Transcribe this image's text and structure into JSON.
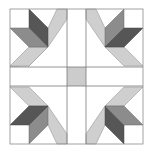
{
  "figure": {
    "type": "quilt-block",
    "colors": {
      "background": "#ffffff",
      "outline": "#8a8a8a",
      "dark": "#565656",
      "medium": "#8c8c8c",
      "light": "#cfcfcf",
      "center": "#cccccc"
    },
    "bounds": {
      "x": 10,
      "y": 8,
      "width": 133,
      "height": 137
    },
    "sashing": {
      "vertical_x": [
        67,
        86
      ],
      "horizontal_y": [
        67,
        86
      ]
    },
    "blocks": [
      {
        "position": "top-left",
        "vertical_petal": "dark",
        "horizontal_petal": "medium"
      },
      {
        "position": "top-right",
        "vertical_petal": "medium",
        "horizontal_petal": "dark"
      },
      {
        "position": "bottom-left",
        "vertical_petal": "medium",
        "horizontal_petal": "dark"
      },
      {
        "position": "bottom-right",
        "vertical_petal": "dark",
        "horizontal_petal": "medium"
      }
    ],
    "center_square": {
      "x": 67,
      "y": 67,
      "size": 19,
      "color": "light-gray"
    }
  }
}
